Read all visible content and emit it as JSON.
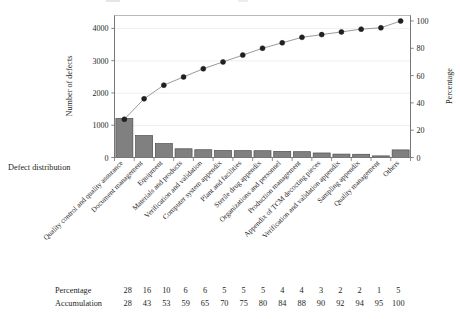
{
  "figure": {
    "left_axis_title": "Number of defects",
    "right_axis_title": "Percentage",
    "corner_label": "Defect distribution"
  },
  "table": {
    "row_labels": [
      "Percentage",
      "Accumulation"
    ],
    "percentage": [
      28,
      16,
      10,
      6,
      6,
      5,
      5,
      5,
      4,
      4,
      3,
      2,
      2,
      1,
      5
    ],
    "accumulation": [
      28,
      43,
      53,
      59,
      65,
      70,
      75,
      80,
      84,
      88,
      90,
      92,
      94,
      95,
      100
    ]
  },
  "chart_data": {
    "type": "bar",
    "title": "",
    "subtitle": "",
    "xlabel": "Defect distribution",
    "ylabel": "Number of defects",
    "y2label": "Percentage",
    "ylim": [
      0,
      4400
    ],
    "y2lim": [
      0,
      104
    ],
    "yticks": [
      0,
      1000,
      2000,
      3000,
      4000
    ],
    "y2ticks": [
      0,
      20,
      40,
      60,
      80,
      100
    ],
    "grid": true,
    "legend": "none",
    "categories": [
      "Quality control and quality assurance",
      "Document management",
      "Equipment",
      "Materials and products",
      "Verification and validation",
      "Computer system appendix",
      "Plant and facilities",
      "Sterile drug appendix",
      "Organizations and personnel",
      "Production management",
      "Appendix of TCM decocting pieces",
      "Verification and validation appendix",
      "Sampling appendix",
      "Quality management",
      "Others"
    ],
    "series": [
      {
        "name": "Number of defects",
        "type": "bar",
        "axis": "left",
        "values": [
          1210,
          680,
          430,
          270,
          240,
          215,
          212,
          210,
          190,
          180,
          140,
          105,
          100,
          50,
          235
        ],
        "color": "#808080",
        "edge_color": "#4d4d4d"
      },
      {
        "name": "Accumulation",
        "type": "line",
        "axis": "right",
        "values": [
          28,
          43,
          53,
          59,
          65,
          70,
          75,
          80,
          84,
          88,
          90,
          92,
          94,
          95,
          100
        ],
        "color": "#8c8c8c",
        "marker_color": "#231f20",
        "marker": "circle"
      }
    ]
  }
}
